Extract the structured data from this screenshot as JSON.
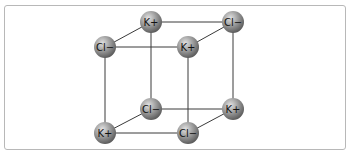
{
  "figure": {
    "frame_border_color": "#b8b8b8",
    "bond_color": "#3a3a3a",
    "sphere_colors": {
      "highlight": "#d8d8d8",
      "mid": "#9a9a9a",
      "shadow": "#5e5e5e"
    },
    "ions": [
      {
        "id": "top-back-left",
        "label": "K+",
        "x": 151,
        "y": 22
      },
      {
        "id": "top-back-right",
        "label": "Cl−",
        "x": 233,
        "y": 22
      },
      {
        "id": "top-front-left",
        "label": "Cl−",
        "x": 105,
        "y": 47
      },
      {
        "id": "top-front-right",
        "label": "K+",
        "x": 188,
        "y": 47
      },
      {
        "id": "bottom-back-left",
        "label": "Cl−",
        "x": 151,
        "y": 109
      },
      {
        "id": "bottom-back-right",
        "label": "K+",
        "x": 233,
        "y": 109
      },
      {
        "id": "bottom-front-left",
        "label": "K+",
        "x": 105,
        "y": 133
      },
      {
        "id": "bottom-front-right",
        "label": "Cl−",
        "x": 188,
        "y": 133
      }
    ],
    "bonds": [
      [
        "top-back-left",
        "top-back-right"
      ],
      [
        "top-front-left",
        "top-front-right"
      ],
      [
        "top-back-left",
        "top-front-left"
      ],
      [
        "top-back-right",
        "top-front-right"
      ],
      [
        "bottom-back-left",
        "bottom-back-right"
      ],
      [
        "bottom-front-left",
        "bottom-front-right"
      ],
      [
        "bottom-back-left",
        "bottom-front-left"
      ],
      [
        "bottom-back-right",
        "bottom-front-right"
      ],
      [
        "top-back-left",
        "bottom-back-left"
      ],
      [
        "top-back-right",
        "bottom-back-right"
      ],
      [
        "top-front-left",
        "bottom-front-left"
      ],
      [
        "top-front-right",
        "bottom-front-right"
      ]
    ]
  }
}
